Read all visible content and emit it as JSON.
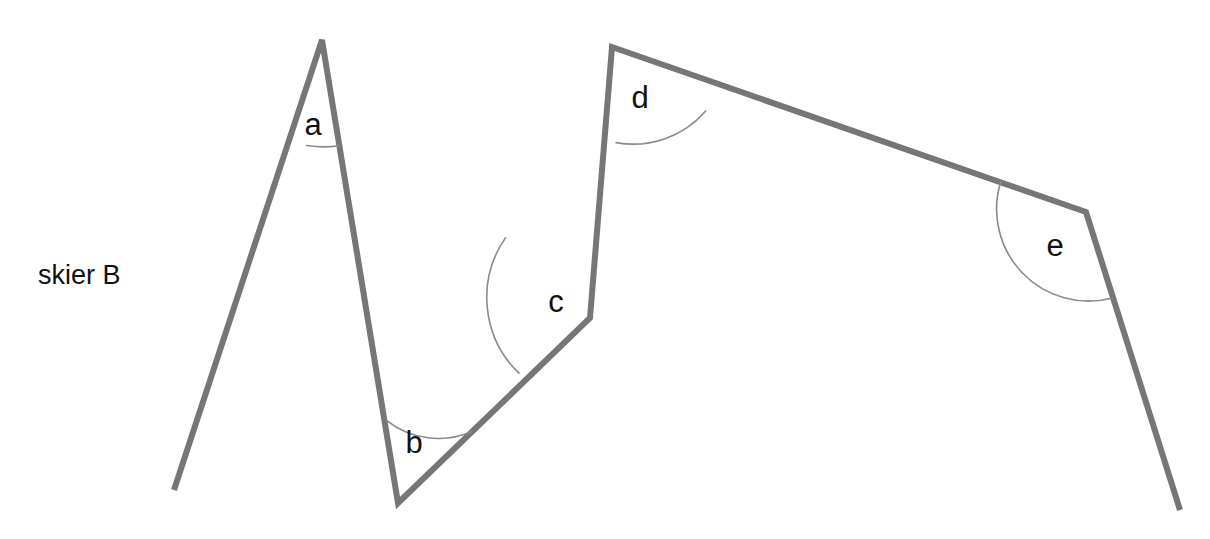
{
  "figure": {
    "caption": "skier B",
    "caption_position": {
      "x": 38,
      "y": 277
    },
    "background_color": "#ffffff",
    "stroke_color": "#767676",
    "stroke_width": 6,
    "arc_color": "#8a8a8a",
    "arc_width": 1.6,
    "label_color": "#111111",
    "width": 1210,
    "height": 539
  },
  "chart_data": {
    "type": "line",
    "title": "skier B",
    "xlabel": "",
    "ylabel": "",
    "xlim": [
      0,
      1210
    ],
    "ylim": [
      539,
      0
    ],
    "grid": false,
    "legend": "none",
    "series": [
      {
        "name": "skier B path",
        "points": [
          {
            "x": 174,
            "y": 490,
            "label": ""
          },
          {
            "x": 322,
            "y": 40,
            "label": "a"
          },
          {
            "x": 398,
            "y": 503,
            "label": "b"
          },
          {
            "x": 590,
            "y": 318,
            "label": "c"
          },
          {
            "x": 612,
            "y": 47,
            "label": "d"
          },
          {
            "x": 1086,
            "y": 212,
            "label": "e"
          },
          {
            "x": 1180,
            "y": 510,
            "label": ""
          }
        ]
      }
    ],
    "annotations": [
      {
        "name": "a",
        "vertex_x": 322,
        "vertex_y": 40,
        "label_x": 313,
        "label_y": 127
      },
      {
        "name": "b",
        "vertex_x": 398,
        "vertex_y": 503,
        "label_x": 414,
        "label_y": 445
      },
      {
        "name": "c",
        "vertex_x": 590,
        "vertex_y": 318,
        "label_x": 556,
        "label_y": 304
      },
      {
        "name": "d",
        "vertex_x": 612,
        "vertex_y": 47,
        "label_x": 640,
        "label_y": 100
      },
      {
        "name": "e",
        "vertex_x": 1086,
        "vertex_y": 212,
        "label_x": 1055,
        "label_y": 248
      }
    ]
  },
  "path": {
    "polyline_points": "174,490 322,40 398,503 590,318 612,47 1086,212 1180,510"
  },
  "arcs": {
    "a": {
      "d": "M 306.6 145.5 A 108 108 0 0 0 339.4 145.7",
      "name": "angle-arc-a"
    },
    "b": {
      "d": "M 386.7 420.6 A 84 84 0 0 0 471.9 431.6",
      "name": "angle-arc-b"
    },
    "c": {
      "d": "M 505.4 237.9 A 105 105 0 0 0 519.0 373.2",
      "name": "angle-arc-c"
    },
    "d": {
      "d": "M 616.0 142.6 A 96 96 0 0 0 705.7 110.9",
      "name": "angle-arc-d"
    },
    "e": {
      "d": "M 1000.6 182.2 A 92 92 0 0 0 1112.4 297.9",
      "name": "angle-arc-e"
    }
  },
  "labels": {
    "a": "a",
    "b": "b",
    "c": "c",
    "d": "d",
    "e": "e"
  }
}
